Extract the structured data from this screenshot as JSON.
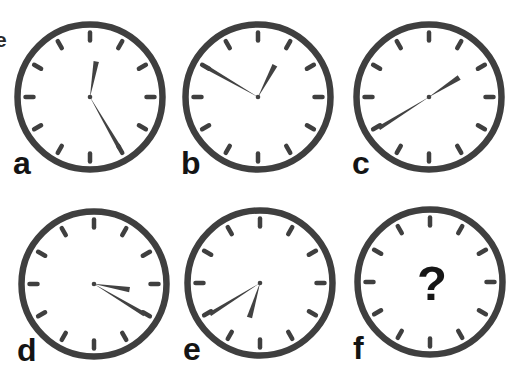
{
  "page": {
    "background": "#ffffff",
    "stray_text_fragment": "e"
  },
  "puzzle": {
    "description_visible": false,
    "grid": {
      "rows": 2,
      "cols": 3
    },
    "colors": {
      "clock_outline": "#3f3f3f",
      "tick_marks": "#3f3f3f",
      "hands": "#424242",
      "labels": "#141414",
      "question_mark": "#161616"
    },
    "clocks": [
      {
        "label": "a",
        "reading": "12:25",
        "hour_angle": 10,
        "minute_angle": 150,
        "has_hands": true,
        "center_text": ""
      },
      {
        "label": "b",
        "reading": "12:50",
        "hour_angle": 28,
        "minute_angle": 300,
        "has_hands": true,
        "center_text": ""
      },
      {
        "label": "c",
        "reading": "1:40",
        "hour_angle": 57,
        "minute_angle": 238,
        "has_hands": true,
        "center_text": ""
      },
      {
        "label": "d",
        "reading": "3:20",
        "hour_angle": 99,
        "minute_angle": 121,
        "has_hands": true,
        "center_text": ""
      },
      {
        "label": "e",
        "reading": "6:40",
        "hour_angle": 197,
        "minute_angle": 238,
        "has_hands": true,
        "center_text": ""
      },
      {
        "label": "f",
        "reading": "?",
        "hour_angle": null,
        "minute_angle": null,
        "has_hands": false,
        "center_text": "?"
      }
    ]
  }
}
